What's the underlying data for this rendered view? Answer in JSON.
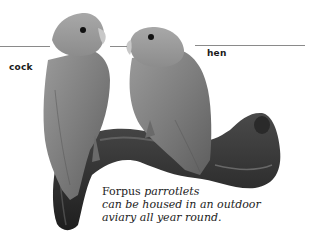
{
  "figure": {
    "labels": {
      "left": "cock",
      "right": "hen"
    },
    "caption": {
      "lead": "Forpus",
      "line1_rest": " parrotlets",
      "line2": "can be housed in an outdoor",
      "line3": "aviary all year round."
    },
    "colors": {
      "leader_line": "#8a8a8a",
      "label_text": "#1a1a1a",
      "caption_text": "#222222"
    }
  }
}
